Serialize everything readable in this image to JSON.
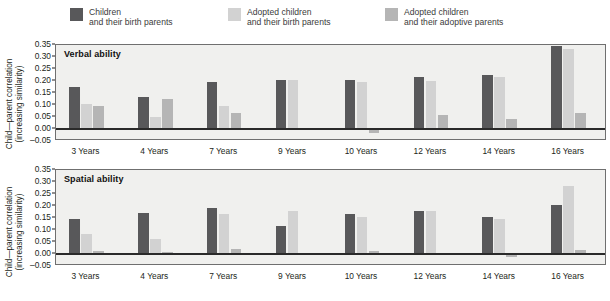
{
  "legend": {
    "items": [
      {
        "key": "birth_children",
        "line1": "Children",
        "line2": "and their birth parents",
        "color": "#58585a"
      },
      {
        "key": "adopted_birth",
        "line1": "Adopted children",
        "line2": "and their birth parents",
        "color": "#d2d2d2"
      },
      {
        "key": "adopted_adoptive",
        "line1": "Adopted children",
        "line2": "and their adoptive parents",
        "color": "#b5b5b5"
      }
    ]
  },
  "axis": {
    "ylabel_line1": "Child—parent correlation",
    "ylabel_line2": "(increasing similarity)",
    "yticks": [
      "0.35",
      "0.30",
      "0.25",
      "0.20",
      "0.15",
      "0.10",
      "0.05",
      "0.00",
      "–0.05"
    ],
    "ymin": -0.05,
    "ymax": 0.35
  },
  "panels": [
    {
      "key": "verbal",
      "title": "Verbal ability"
    },
    {
      "key": "spatial",
      "title": "Spatial ability"
    }
  ],
  "chart_data": [
    {
      "type": "bar",
      "title": "Verbal ability",
      "xlabel": "",
      "ylabel": "Child—parent correlation (increasing similarity)",
      "ylim": [
        -0.05,
        0.35
      ],
      "grid": false,
      "legend_position": "top",
      "categories": [
        "3 Years",
        "4 Years",
        "7 Years",
        "9 Years",
        "10 Years",
        "12 Years",
        "14 Years",
        "16 Years"
      ],
      "series": [
        {
          "name": "Children and their birth parents",
          "color": "#58585a",
          "values": [
            0.175,
            0.135,
            0.195,
            0.205,
            0.205,
            0.215,
            0.225,
            0.345
          ]
        },
        {
          "name": "Adopted children and their birth parents",
          "color": "#d2d2d2",
          "values": [
            0.105,
            0.048,
            0.095,
            0.205,
            0.195,
            0.2,
            0.215,
            0.335
          ]
        },
        {
          "name": "Adopted children and their adoptive parents",
          "color": "#b5b5b5",
          "values": [
            0.095,
            0.125,
            0.065,
            0.0,
            -0.018,
            0.06,
            0.04,
            0.065
          ]
        }
      ]
    },
    {
      "type": "bar",
      "title": "Spatial ability",
      "xlabel": "",
      "ylabel": "Child—parent correlation (increasing similarity)",
      "ylim": [
        -0.05,
        0.35
      ],
      "grid": false,
      "legend_position": "top",
      "categories": [
        "3 Years",
        "4 Years",
        "7 Years",
        "9 Years",
        "10 Years",
        "12 Years",
        "14 Years",
        "16 Years"
      ],
      "series": [
        {
          "name": "Children and their birth parents",
          "color": "#58585a",
          "values": [
            0.147,
            0.17,
            0.19,
            0.115,
            0.165,
            0.18,
            0.155,
            0.205
          ]
        },
        {
          "name": "Adopted children and their birth parents",
          "color": "#d2d2d2",
          "values": [
            0.085,
            0.062,
            0.165,
            0.18,
            0.155,
            0.18,
            0.145,
            0.285
          ]
        },
        {
          "name": "Adopted children and their adoptive parents",
          "color": "#b5b5b5",
          "values": [
            0.013,
            0.007,
            0.022,
            0.006,
            0.012,
            0.005,
            -0.012,
            0.015
          ]
        }
      ]
    }
  ]
}
